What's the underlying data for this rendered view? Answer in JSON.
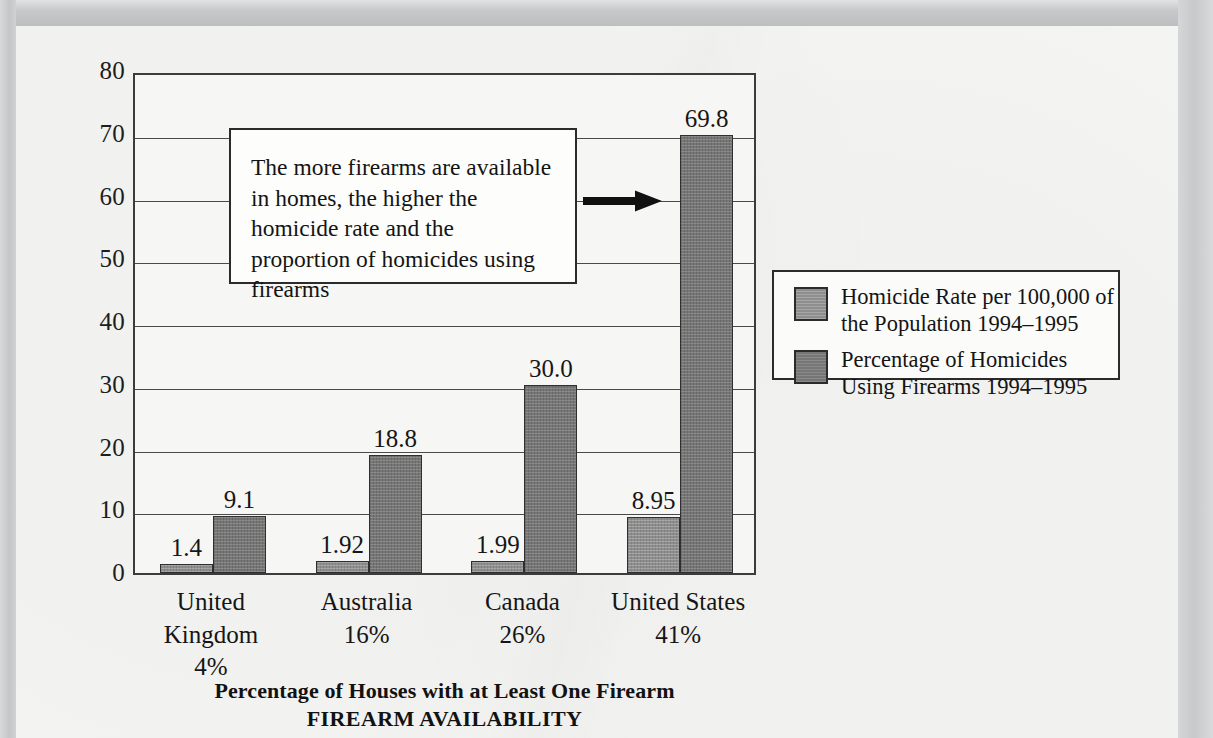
{
  "chart_data": {
    "type": "bar",
    "title": "",
    "xlabel": "Percentage of Houses with at Least One Firearm",
    "xlabel2": "FIREARM AVAILABILITY",
    "ylabel": "",
    "ylim": [
      0,
      80
    ],
    "ytick_step": 10,
    "yticks": [
      "80",
      "70",
      "60",
      "50",
      "40",
      "30",
      "20",
      "10",
      "0"
    ],
    "grid": true,
    "legend_position": "right",
    "categories": [
      "United Kingdom",
      "Australia",
      "Canada",
      "United States"
    ],
    "category_sublabels": [
      "4%",
      "16%",
      "26%",
      "41%"
    ],
    "series": [
      {
        "name": "Homicide Rate per 100,000 of the Population 1994–1995",
        "color": "#8e8e8e",
        "values": [
          1.4,
          1.92,
          1.99,
          8.95
        ],
        "labels": [
          "1.4",
          "1.92",
          "1.99",
          "8.95"
        ]
      },
      {
        "name": "Percentage of Homicides Using Firearms 1994–1995",
        "color": "#767676",
        "values": [
          9.1,
          18.8,
          30.0,
          69.8
        ],
        "labels": [
          "9.1",
          "18.8",
          "30.0",
          "69.8"
        ]
      }
    ],
    "annotation": "The more firearms are available in homes, the higher the homicide rate and the proportion of homicides using firearms"
  },
  "legend": {
    "items": [
      {
        "label": "Homicide Rate per 100,000 of the Population 1994–1995"
      },
      {
        "label": "Percentage of Homicides Using Firearms 1994–1995"
      }
    ]
  },
  "colors": {
    "series_1": "#8e8e8e",
    "series_2": "#767676",
    "page": "#f4f4f2",
    "ink": "#161616"
  }
}
